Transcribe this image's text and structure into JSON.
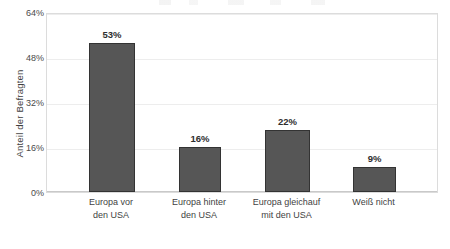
{
  "chart_data": {
    "type": "bar",
    "title": "",
    "xlabel": "",
    "ylabel": "Anteil der Befragten",
    "categories": [
      "Europa vor den USA",
      "Europa hinter den USA",
      "Europa gleichauf mit den USA",
      "Weiß nicht"
    ],
    "category_lines": [
      [
        "Europa vor",
        "den USA"
      ],
      [
        "Europa hinter",
        "den USA"
      ],
      [
        "Europa gleichauf",
        "mit den USA"
      ],
      [
        "Weiß nicht",
        ""
      ]
    ],
    "values": [
      53,
      16,
      22,
      9
    ],
    "value_labels": [
      "53%",
      "16%",
      "22%",
      "9%"
    ],
    "ylim": [
      0,
      64
    ],
    "yticks": [
      0,
      16,
      32,
      48,
      64
    ],
    "ytick_labels": [
      "0%",
      "16%",
      "32%",
      "48%",
      "64%"
    ],
    "grid": true,
    "legend": "none",
    "bar_color": "#565656",
    "bar_border_color": "#333333",
    "gridline_color": "#ededed",
    "plot_border_color": "#dcdcdc",
    "text_color": "#3f3f3f"
  }
}
